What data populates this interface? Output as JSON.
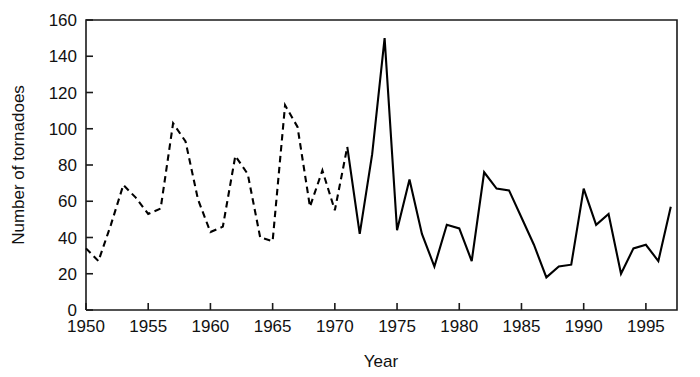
{
  "chart_data": {
    "type": "line",
    "title": "",
    "xlabel": "Year",
    "ylabel": "Number of tornadoes",
    "xlim": [
      1950,
      1997.5
    ],
    "ylim": [
      0,
      160
    ],
    "grid": false,
    "legend": "none",
    "xticks": [
      1950,
      1955,
      1960,
      1965,
      1970,
      1975,
      1980,
      1985,
      1990,
      1995
    ],
    "xtick_labels": [
      "1950",
      "1955",
      "1960",
      "1965",
      "1970",
      "1975",
      "1980",
      "1985",
      "1990",
      "1995"
    ],
    "yticks": [
      0,
      20,
      40,
      60,
      80,
      100,
      120,
      140,
      160
    ],
    "ytick_labels": [
      "0",
      "20",
      "40",
      "60",
      "80",
      "100",
      "120",
      "140",
      "160"
    ],
    "line_color": "#000000",
    "series": [
      {
        "name": "Tornadoes (dashed segment)",
        "style": "dashed",
        "x": [
          1950,
          1951,
          1952,
          1953,
          1954,
          1955,
          1956,
          1957,
          1958,
          1959,
          1960,
          1961,
          1962,
          1963,
          1964,
          1965,
          1966,
          1967,
          1968,
          1969,
          1970,
          1971
        ],
        "values": [
          34,
          27,
          47,
          69,
          62,
          53,
          56,
          103,
          93,
          61,
          43,
          46,
          85,
          75,
          40,
          38,
          113,
          101,
          57,
          77,
          55,
          90
        ]
      },
      {
        "name": "Tornadoes (solid segment)",
        "style": "solid",
        "x": [
          1971,
          1972,
          1973,
          1974,
          1975,
          1976,
          1977,
          1978,
          1979,
          1980,
          1981,
          1982,
          1983,
          1984,
          1985,
          1986,
          1987,
          1988,
          1989,
          1990,
          1991,
          1992,
          1993,
          1994,
          1995,
          1996,
          1997
        ],
        "values": [
          90,
          42,
          86,
          150,
          44,
          72,
          42,
          24,
          47,
          45,
          27,
          76,
          67,
          66,
          51,
          36,
          18,
          24,
          25,
          67,
          47,
          53,
          20,
          34,
          36,
          27,
          57
        ]
      }
    ]
  },
  "axes": {
    "x_title": "Year",
    "y_title": "Number of tornadoes"
  }
}
